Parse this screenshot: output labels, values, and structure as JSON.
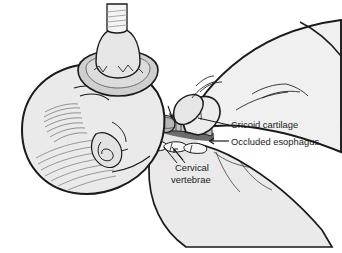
{
  "figure": {
    "background_color": "#ffffff",
    "ink_color": "#1a1a1a"
  },
  "palette": {
    "outline": "#1a1a1a",
    "skin_fill": "#e9e9e9",
    "skin_shadow": "#d6d6d6",
    "hand_fill": "#efefef",
    "mask_fill": "#d2d2d2",
    "mask_rim": "#bfbfbf",
    "tube_fill": "#f2f2f2",
    "esophagus_dark": "#6b6b6b",
    "trachea_fill": "#b9b9b9",
    "vertebrae_fill": "#f4f4f4",
    "leader_line": "#1a1a1a"
  },
  "labels": [
    {
      "id": "cricoid-cartilage",
      "text": "Cricoid cartilage",
      "x": 231,
      "y": 128,
      "anchor": "start",
      "pointer": "leader-line",
      "leader": {
        "x1": 228,
        "y1": 125,
        "x2": 198,
        "y2": 118
      }
    },
    {
      "id": "occluded-esophagus",
      "text": "Occluded esophagus",
      "x": 231,
      "y": 145,
      "anchor": "start",
      "pointer": "arrow-left",
      "arrow": {
        "x1": 228,
        "y1": 141,
        "x2": 208,
        "y2": 141
      }
    },
    {
      "id": "cervical-vertebrae-line1",
      "text": "Cervical",
      "x": 175,
      "y": 171,
      "anchor": "start",
      "pointer": "leader-line",
      "leader": {
        "x1": 176,
        "y1": 164,
        "x2": 163,
        "y2": 146
      }
    },
    {
      "id": "cervical-vertebrae-line2",
      "text": "vertebrae",
      "x": 171,
      "y": 183,
      "anchor": "start",
      "pointer": "leader-line",
      "leader": {
        "x1": 190,
        "y1": 164,
        "x2": 172,
        "y2": 146
      }
    }
  ],
  "anatomy": {
    "parts": [
      {
        "id": "infant-head",
        "name": "infant head"
      },
      {
        "id": "infant-ear",
        "name": "ear"
      },
      {
        "id": "infant-neck",
        "name": "neck"
      },
      {
        "id": "infant-torso",
        "name": "shoulder and torso"
      },
      {
        "id": "face-mask",
        "name": "face mask"
      },
      {
        "id": "bag-valve-connector",
        "name": "bag valve connector tube"
      },
      {
        "id": "trachea",
        "name": "trachea with tracheal rings"
      },
      {
        "id": "cricoid-ring",
        "name": "cricoid cartilage ring"
      },
      {
        "id": "esophagus",
        "name": "occluded esophagus"
      },
      {
        "id": "cervical-vertebrae",
        "name": "cervical vertebrae"
      },
      {
        "id": "clinician-hand",
        "name": "clinician hand applying cricoid pressure"
      },
      {
        "id": "thumb",
        "name": "thumb"
      },
      {
        "id": "index-finger",
        "name": "index finger"
      }
    ]
  }
}
